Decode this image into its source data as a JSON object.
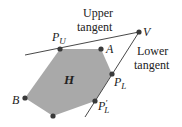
{
  "diagram": {
    "hull_label": "H",
    "colors": {
      "hull_fill": "#a9a9a9",
      "line": "#333333",
      "point": "#3a3a3a"
    },
    "labels": {
      "upper_tangent_line1": "Upper",
      "upper_tangent_line2": "tangent",
      "lower_tangent_line1": "Lower",
      "lower_tangent_line2": "tangent",
      "V": "V",
      "A": "A",
      "B": "B",
      "P": "P",
      "U_sub": "U",
      "L_sub": "L",
      "prime": "′"
    },
    "points": [
      {
        "name": "P_U",
        "x": 60,
        "y": 49
      },
      {
        "name": "A",
        "x": 101,
        "y": 49
      },
      {
        "name": "P_L",
        "x": 112,
        "y": 74
      },
      {
        "name": "P'_L",
        "x": 95,
        "y": 101
      },
      {
        "name": "bottom",
        "x": 53,
        "y": 116
      },
      {
        "name": "B",
        "x": 25,
        "y": 98
      },
      {
        "name": "V",
        "x": 139,
        "y": 32
      }
    ]
  }
}
